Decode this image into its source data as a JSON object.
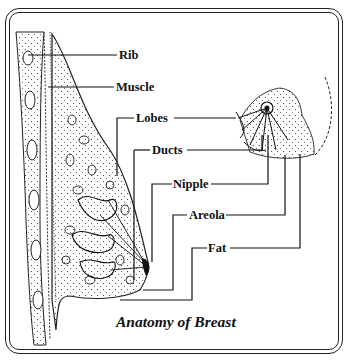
{
  "diagram": {
    "caption": "Anatomy of Breast",
    "labels": {
      "rib": "Rib",
      "muscle": "Muscle",
      "lobes": "Lobes",
      "ducts": "Ducts",
      "nipple": "Nipple",
      "areola": "Areola",
      "fat": "Fat"
    },
    "colors": {
      "ink": "#111111",
      "background": "#ffffff"
    }
  }
}
